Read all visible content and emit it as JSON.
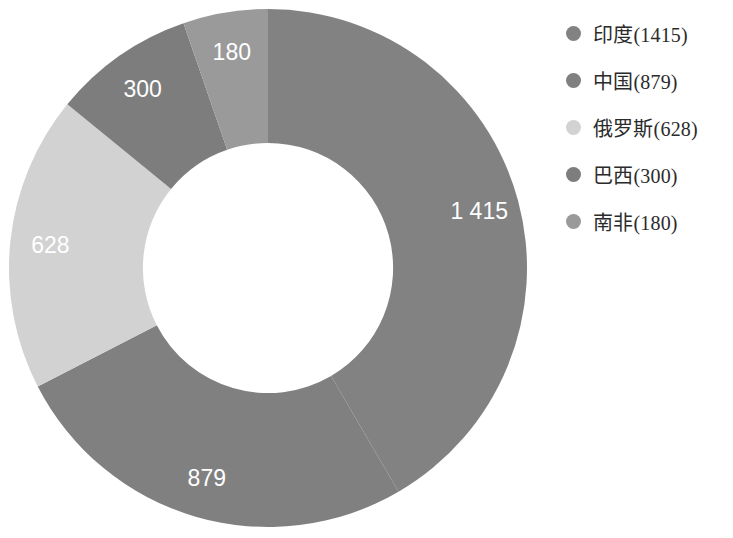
{
  "chart_data": {
    "type": "pie",
    "variant": "donut",
    "title": "",
    "subtitle": "",
    "xlabel": "",
    "ylabel": "",
    "grid": false,
    "legend_position": "right",
    "total": 3402,
    "start_angle_deg": -90,
    "direction": "clockwise",
    "inner_radius_ratio": 0.483,
    "categories": [
      "印度",
      "中国",
      "俄罗斯",
      "巴西",
      "南非"
    ],
    "values": [
      1415,
      879,
      628,
      300,
      180
    ],
    "slice_labels": [
      "1 415",
      "879",
      "628",
      "300",
      "180"
    ],
    "colors": [
      "#828282",
      "#808080",
      "#d2d2d2",
      "#7d7d7d",
      "#9a9a9a"
    ],
    "slices": [
      {
        "name": "印度",
        "value": 1415,
        "label": "1 415",
        "color": "#828282",
        "percent": 41.59
      },
      {
        "name": "中国",
        "value": 879,
        "label": "879",
        "color": "#808080",
        "percent": 25.84
      },
      {
        "name": "俄罗斯",
        "value": 628,
        "label": "628",
        "color": "#d2d2d2",
        "percent": 18.46
      },
      {
        "name": "巴西",
        "value": 300,
        "label": "300",
        "color": "#7d7d7d",
        "percent": 8.82
      },
      {
        "name": "南非",
        "value": 180,
        "label": "180",
        "color": "#9a9a9a",
        "percent": 5.29
      }
    ]
  },
  "legend": {
    "items": [
      {
        "label": "印度(1415)",
        "color": "#828282"
      },
      {
        "label": "中国(879)",
        "color": "#808080"
      },
      {
        "label": "俄罗斯(628)",
        "color": "#d2d2d2"
      },
      {
        "label": "巴西(300)",
        "color": "#7d7d7d"
      },
      {
        "label": "南非(180)",
        "color": "#9a9a9a"
      }
    ]
  }
}
